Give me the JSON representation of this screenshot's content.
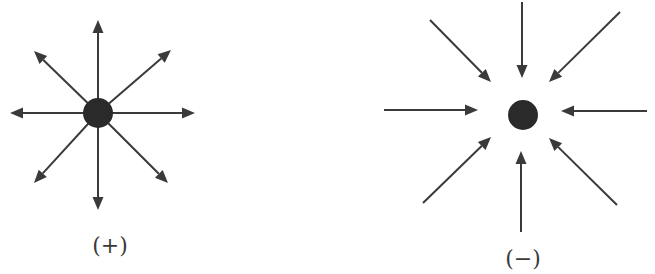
{
  "diagram": {
    "colors": {
      "line": "#3a3a3a",
      "charge": "#2a2a2a",
      "background": "#ffffff"
    },
    "charges": [
      {
        "id": "positive",
        "label": "(+)",
        "label_pos": [
          110,
          245
        ],
        "center": [
          98,
          113
        ],
        "radius": 15,
        "field_direction": "outward",
        "arrows": [
          {
            "from": [
              98,
              113
            ],
            "to": [
              98,
              20
            ]
          },
          {
            "from": [
              98,
              113
            ],
            "to": [
              98,
              210
            ]
          },
          {
            "from": [
              98,
              113
            ],
            "to": [
              10,
              113
            ]
          },
          {
            "from": [
              98,
              113
            ],
            "to": [
              195,
              113
            ]
          },
          {
            "from": [
              98,
              113
            ],
            "to": [
              34,
              51
            ]
          },
          {
            "from": [
              98,
              113
            ],
            "to": [
              171,
              50
            ]
          },
          {
            "from": [
              98,
              113
            ],
            "to": [
              34,
              183
            ]
          },
          {
            "from": [
              98,
              113
            ],
            "to": [
              168,
              183
            ]
          }
        ]
      },
      {
        "id": "negative",
        "label": "(−)",
        "label_pos": [
          523,
          258
        ],
        "center": [
          523,
          115
        ],
        "radius": 15,
        "field_direction": "inward",
        "arrows": [
          {
            "from": [
              522,
              2
            ],
            "to": [
              522,
              78
            ]
          },
          {
            "from": [
              521,
              232
            ],
            "to": [
              521,
              151
            ]
          },
          {
            "from": [
              384,
              110
            ],
            "to": [
              478,
              110
            ]
          },
          {
            "from": [
              647,
              111
            ],
            "to": [
              561,
              111
            ]
          },
          {
            "from": [
              430,
              20
            ],
            "to": [
              491,
              82
            ]
          },
          {
            "from": [
              620,
              12
            ],
            "to": [
              549,
              82
            ]
          },
          {
            "from": [
              423,
              203
            ],
            "to": [
              491,
              137
            ]
          },
          {
            "from": [
              617,
              205
            ],
            "to": [
              549,
              138
            ]
          }
        ]
      }
    ]
  }
}
